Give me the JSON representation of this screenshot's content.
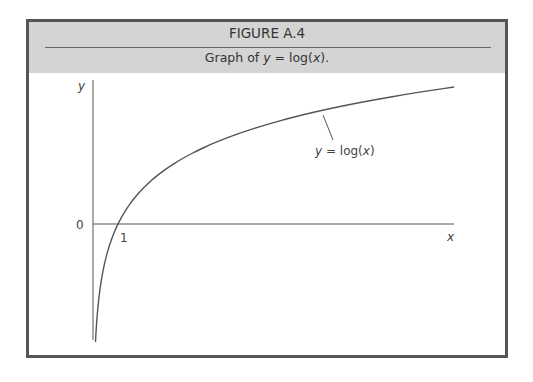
{
  "figure": {
    "number": "FIGURE A.4",
    "caption": "Graph of y = log(x)."
  },
  "chart_data": {
    "type": "line",
    "title": "Graph of y = log(x).",
    "xlabel": "x",
    "ylabel": "y",
    "tick_labels": {
      "x": [
        "1"
      ],
      "y": [
        "0"
      ]
    },
    "annotations": [
      "y = log(x)"
    ],
    "grid": false,
    "series": [
      {
        "name": "y = log(x)",
        "x": [
          0.1,
          0.2,
          0.5,
          1,
          2,
          4,
          6,
          8,
          10,
          12,
          14.4
        ],
        "values": [
          -2.3,
          -1.61,
          -0.69,
          0,
          0.69,
          1.39,
          1.79,
          2.08,
          2.3,
          2.48,
          2.67
        ]
      }
    ]
  },
  "labels": {
    "y_axis": "y",
    "x_axis": "x",
    "zero": "0",
    "one": "1",
    "curve_y": "y",
    "curve_eq": " = log(",
    "curve_x": "x",
    "curve_close": ")"
  }
}
